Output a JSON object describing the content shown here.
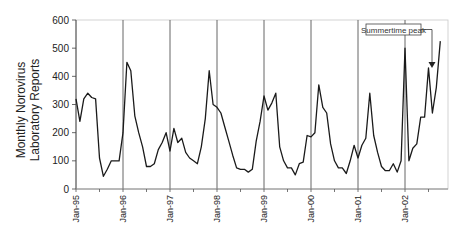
{
  "chart_data": {
    "type": "line",
    "title": "",
    "xlabel": "",
    "ylabel": "Monthly Norovirus Laboratory Reports",
    "ylabel_lines": [
      "Monthly Norovirus",
      "Laboratory Reports"
    ],
    "ylim": [
      0,
      600
    ],
    "yticks": [
      0,
      100,
      200,
      300,
      400,
      500,
      600
    ],
    "xtick_labels": [
      "Jan-95",
      "Jan-96",
      "Jan-97",
      "Jan-98",
      "Jan-99",
      "Jan-00",
      "Jan-01",
      "Jan-02"
    ],
    "grid": {
      "vertical_at_year_starts": true,
      "horizontal": false
    },
    "legend": null,
    "line_color": "#1a1a1a",
    "annotation": {
      "text": "Summertime peak",
      "points_to": "Jul-02"
    },
    "series": [
      {
        "name": "Monthly Norovirus Laboratory Reports",
        "start": "Jan-95",
        "values": [
          320,
          240,
          320,
          340,
          325,
          320,
          110,
          45,
          70,
          100,
          100,
          100,
          200,
          450,
          420,
          260,
          200,
          150,
          80,
          80,
          90,
          140,
          165,
          200,
          135,
          215,
          165,
          180,
          130,
          110,
          100,
          90,
          150,
          250,
          420,
          300,
          290,
          270,
          220,
          170,
          120,
          75,
          70,
          70,
          60,
          70,
          170,
          240,
          330,
          280,
          305,
          340,
          150,
          100,
          75,
          75,
          50,
          90,
          95,
          190,
          185,
          200,
          370,
          290,
          270,
          160,
          100,
          75,
          75,
          55,
          100,
          155,
          110,
          155,
          180,
          340,
          190,
          130,
          80,
          65,
          65,
          90,
          60,
          100,
          500,
          100,
          145,
          160,
          255,
          255,
          430,
          270,
          360,
          525
        ]
      }
    ]
  }
}
